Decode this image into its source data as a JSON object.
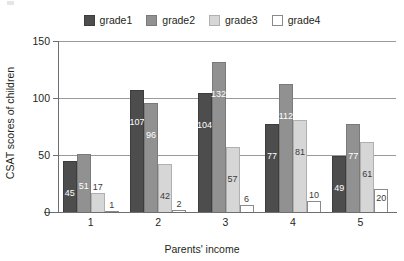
{
  "chart_data": {
    "type": "bar",
    "title": "",
    "subtitle": "",
    "xlabel": "Parents' income",
    "ylabel": "CSAT scores of children",
    "categories": [
      "1",
      "2",
      "3",
      "4",
      "5"
    ],
    "series": [
      {
        "name": "grade1",
        "color": "#4d4d4d",
        "values": [
          45,
          107,
          104,
          77,
          49
        ]
      },
      {
        "name": "grade2",
        "color": "#919191",
        "values": [
          51,
          96,
          132,
          112,
          77
        ]
      },
      {
        "name": "grade3",
        "color": "#d6d6d6",
        "values": [
          17,
          42,
          57,
          81,
          61
        ]
      },
      {
        "name": "grade4",
        "color": "#ffffff",
        "values": [
          1,
          2,
          6,
          10,
          20
        ]
      }
    ],
    "ylim": [
      0,
      150
    ],
    "yticks": [
      0,
      50,
      100,
      150
    ],
    "ytick_labels": [
      "0",
      "50",
      "100",
      "150"
    ],
    "grid": true,
    "grid_axis": "y",
    "legend_position": "top-center",
    "bar_value_labels": true
  },
  "legend": {
    "entries": [
      {
        "label": "grade1"
      },
      {
        "label": "grade2"
      },
      {
        "label": "grade3"
      },
      {
        "label": "grade4"
      }
    ]
  },
  "axes": {
    "y_title": "CSAT scores of children",
    "x_title": "Parents' income",
    "y_tick_labels": [
      "0",
      "50",
      "100",
      "150"
    ],
    "x_tick_labels": [
      "1",
      "2",
      "3",
      "4",
      "5"
    ]
  }
}
